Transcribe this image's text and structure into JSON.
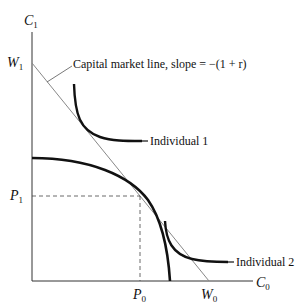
{
  "diagram": {
    "axes": {
      "y_label": "C",
      "y_sub": "1",
      "x_label": "C",
      "x_sub": "0"
    },
    "points": {
      "W1": {
        "label": "W",
        "sub": "1"
      },
      "P1": {
        "label": "P",
        "sub": "1"
      },
      "P0": {
        "label": "P",
        "sub": "0"
      },
      "W0": {
        "label": "W",
        "sub": "0"
      }
    },
    "annotations": {
      "capital_market_line": "Capital market line, slope = −(1 + r)",
      "individual_1": "Individual 1",
      "individual_2": "Individual 2"
    },
    "colors": {
      "curve": "#111111",
      "line": "#777777",
      "dashed": "#444444"
    }
  }
}
